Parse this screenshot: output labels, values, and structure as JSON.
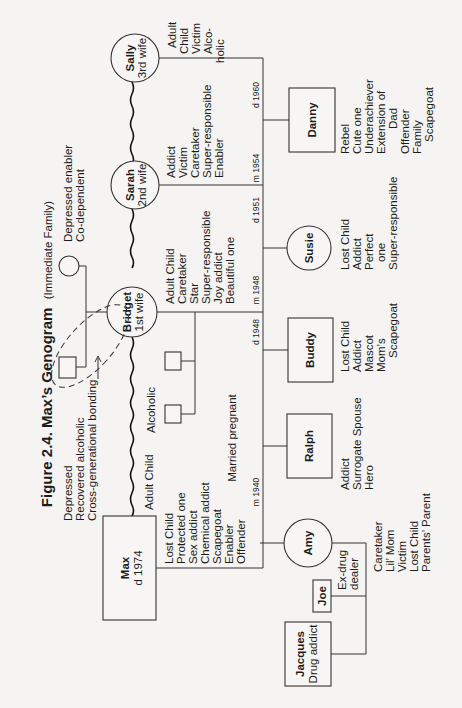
{
  "figure": {
    "title": "Figure 2.4. Max’s Genogram",
    "subtitle": "(Immediate Family)"
  },
  "nodes": {
    "max": {
      "name": "Max",
      "detail": "d 1974",
      "traits": [
        "Lost Child",
        "Protected one",
        "Sex addict",
        "Chemical addict",
        "Scapegoat",
        "Enabler",
        "Offender"
      ],
      "above": "Adult Child"
    },
    "bridget": {
      "name": "Bridget",
      "detail": "1st wife",
      "traits": [
        "Adult Child",
        "Caretaker",
        "Star",
        "Super-responsible",
        "Joy addict",
        "Beautiful one"
      ]
    },
    "sarah": {
      "name": "Sarah",
      "detail": "2nd wife",
      "traits": [
        "Addict",
        "Victim",
        "Caretaker",
        "Super-responsible",
        "Enabler"
      ]
    },
    "sally": {
      "name": "Sally",
      "detail": "3rd wife",
      "traits": [
        "Adult",
        "Child",
        "Victim",
        "Alco-",
        "holic"
      ]
    },
    "amy": {
      "name": "Amy",
      "traits": [
        "Caretaker",
        "Lil’ Mom",
        "Victim",
        "Lost Child",
        "Parents’ Parent"
      ]
    },
    "joe": {
      "name": "Joe",
      "traits": [
        "Ex-drug",
        "dealer"
      ]
    },
    "jacques": {
      "name": "Jacques",
      "detail": "Drug addict"
    },
    "ralph": {
      "name": "Ralph",
      "traits": [
        "Addict",
        "Surrogate Spouse",
        "Hero"
      ]
    },
    "buddy": {
      "name": "Buddy",
      "traits": [
        "Lost Child",
        "Addict",
        "Mascot",
        "Mom’s",
        "Scapegoat"
      ]
    },
    "susie": {
      "name": "Susie",
      "traits": [
        "Lost Child",
        "Addict",
        "Perfect",
        "one",
        "Super-responsible"
      ]
    },
    "danny": {
      "name": "Danny",
      "traits": [
        "Rebel",
        "Cute one",
        "Underachiever",
        "Extension of",
        "Dad",
        "Offender",
        "Family",
        "Scapegoat"
      ]
    },
    "bridget_mother": {
      "traits": [
        "Depressed enabler",
        "Co-dependent"
      ]
    },
    "bridget_father": {
      "traits": [
        "Depressed",
        "Recovered alcoholic",
        "Cross-generational bonding"
      ]
    },
    "bridget_siblings": {
      "label": "Alcoholic"
    }
  },
  "events": {
    "m1940": "m 1940",
    "married_pregnant": "Married pregnant",
    "d1948": "d 1948",
    "m1948": "m 1948",
    "d1951": "d 1951",
    "m1954": "m 1954",
    "d1960": "d 1960"
  }
}
